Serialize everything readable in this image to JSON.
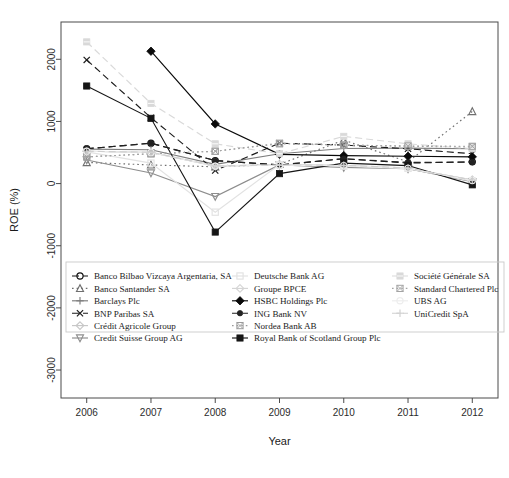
{
  "chart_data": {
    "type": "line",
    "title": "",
    "xlabel": "Year",
    "ylabel": "ROE (%)",
    "x": [
      2006,
      2007,
      2008,
      2009,
      2010,
      2011,
      2012
    ],
    "xtick_labels": [
      "2006",
      "2007",
      "2008",
      "2009",
      "2010",
      "2011",
      "2012"
    ],
    "ytick_labels": [
      "2000",
      "1000",
      "0",
      "-1000",
      "-2000",
      "-3000"
    ],
    "ytick_values": [
      2000,
      1000,
      0,
      -1000,
      -2000,
      -3000
    ],
    "xlim": [
      2005.6,
      2012.4
    ],
    "ylim": [
      -3450,
      2600
    ],
    "grid": false,
    "legend_position": "bottom-inside-box",
    "series": [
      {
        "name": "Banco Bilbao Vizcaya Argentaria, SA",
        "values": [
          560,
          650,
          370,
          300,
          400,
          330,
          350
        ],
        "color": "#111111",
        "dash": "dashed",
        "marker": "circle-open"
      },
      {
        "name": "Banco Santander SA",
        "values": [
          340,
          300,
          270,
          310,
          700,
          350,
          1160
        ],
        "color": "#6f6f6f",
        "dash": "dotted",
        "marker": "triangle-open"
      },
      {
        "name": "Barclays Plc",
        "values": [
          555,
          545,
          310,
          480,
          565,
          570,
          560
        ],
        "color": "#7d7d7d",
        "dash": "solid",
        "marker": "plus"
      },
      {
        "name": "BNP Paribas SA",
        "values": [
          1990,
          1060,
          210,
          650,
          620,
          560,
          480
        ],
        "color": "#1b1b1b",
        "dash": "dashed",
        "marker": "cross"
      },
      {
        "name": "Crédit Agricole Group",
        "values": [
          520,
          500,
          280,
          300,
          290,
          240,
          60
        ],
        "color": "#c7c7c7",
        "dash": "solid",
        "marker": "diamond-open"
      },
      {
        "name": "Credit Suisse Group AG",
        "values": [
          380,
          170,
          -210,
          300,
          260,
          240,
          30
        ],
        "color": "#8d8d8d",
        "dash": "solid",
        "marker": "triangle-down"
      },
      {
        "name": "Deutsche Bank AG",
        "values": [
          510,
          330,
          -460,
          305,
          280,
          245,
          40
        ],
        "color": "#e2e2e2",
        "dash": "solid",
        "marker": "square-open"
      },
      {
        "name": "Groupe BPCE",
        "values": [
          520,
          500,
          285,
          300,
          295,
          250,
          55
        ],
        "color": "#d5d5d5",
        "dash": "solid",
        "marker": "diamond-open"
      },
      {
        "name": "HSBC Holdings Plc",
        "values": [
          null,
          2130,
          960,
          470,
          450,
          440,
          430
        ],
        "color": "#0a0a0a",
        "dash": "solid",
        "marker": "diamond-filled"
      },
      {
        "name": "ING Bank NV",
        "values": [
          560,
          650,
          370,
          300,
          400,
          340,
          345
        ],
        "color": "#222222",
        "dash": "dashed",
        "marker": "circle-filled"
      },
      {
        "name": "Nordea Bank AB",
        "values": [
          430,
          480,
          520,
          640,
          620,
          600,
          590
        ],
        "color": "#9a9a9a",
        "dash": "dotted",
        "marker": "square-x"
      },
      {
        "name": "Royal Bank of Scotland Group Plc",
        "values": [
          1570,
          1050,
          -780,
          160,
          330,
          290,
          -20
        ],
        "color": "#161616",
        "dash": "solid",
        "marker": "square-filled"
      },
      {
        "name": "Société Générale SA",
        "values": [
          2280,
          1290,
          640,
          480,
          760,
          640,
          560
        ],
        "color": "#d9d9d9",
        "dash": "dashed",
        "marker": "square-shaded"
      },
      {
        "name": "Standard Chartered Plc",
        "values": [
          430,
          480,
          520,
          650,
          620,
          605,
          600
        ],
        "color": "#a3a3a3",
        "dash": "dotted",
        "marker": "square-x"
      },
      {
        "name": "UBS AG",
        "values": [
          520,
          500,
          280,
          295,
          290,
          245,
          50
        ],
        "color": "#ededed",
        "dash": "solid",
        "marker": "circle-open"
      },
      {
        "name": "UniCredit SpA",
        "values": [
          520,
          505,
          285,
          300,
          295,
          250,
          55
        ],
        "color": "#cfcfcf",
        "dash": "dashed",
        "marker": "plus"
      }
    ],
    "legend_columns": [
      [
        "Banco Bilbao Vizcaya Argentaria, SA",
        "Banco Santander SA",
        "Barclays Plc",
        "BNP Paribas SA",
        "Crédit Agricole Group",
        "Credit Suisse Group AG"
      ],
      [
        "Deutsche Bank AG",
        "Groupe BPCE",
        "HSBC Holdings Plc",
        "ING Bank NV",
        "Nordea Bank AB",
        "Royal Bank of Scotland Group Plc"
      ],
      [
        "Société Générale SA",
        "Standard Chartered Plc",
        "UBS AG",
        "UniCredit SpA"
      ]
    ]
  }
}
